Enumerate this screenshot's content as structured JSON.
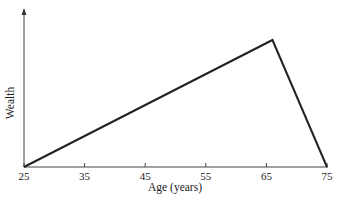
{
  "chart_data": {
    "type": "line",
    "title": "",
    "xlabel": "Age (years)",
    "ylabel": "Wealth",
    "x": [
      25,
      66,
      75
    ],
    "series": [
      {
        "name": "Wealth",
        "values": [
          0,
          100,
          0
        ]
      }
    ],
    "xticks": [
      25,
      35,
      45,
      55,
      65,
      75
    ],
    "xlim": [
      25,
      75
    ],
    "ylim": [
      0,
      105
    ],
    "yticks": [],
    "grid": false,
    "legend": null
  },
  "labels": {
    "xlabel": "Age (years)",
    "ylabel": "Wealth",
    "ticks": [
      "25",
      "35",
      "45",
      "55",
      "65",
      "75"
    ]
  }
}
